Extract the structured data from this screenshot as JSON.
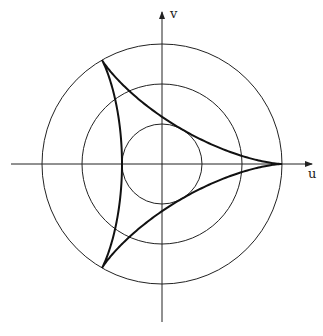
{
  "diagram": {
    "axes": {
      "x_label": "u",
      "y_label": "v"
    },
    "center": [
      162,
      164
    ],
    "circle_radii": [
      40,
      80,
      120
    ],
    "deltoid_small_radius": 40,
    "colors": {
      "line": "#222222",
      "curve": "#111111",
      "background": "#ffffff"
    }
  }
}
